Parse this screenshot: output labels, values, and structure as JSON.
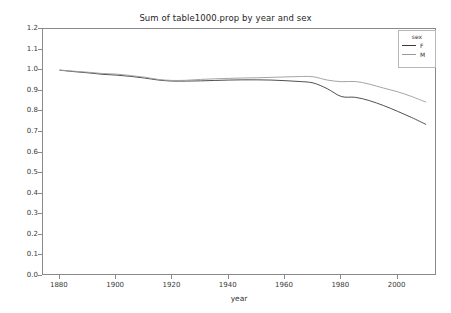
{
  "chart_data": {
    "type": "line",
    "title": "Sum of table1000.prop by year and sex",
    "xlabel": "year",
    "ylabel": "",
    "xlim": [
      1874,
      2014
    ],
    "ylim": [
      0.0,
      1.2
    ],
    "grid": false,
    "legend": {
      "title": "sex",
      "position": "upper right",
      "entries": [
        {
          "name": "F",
          "color": "#3b3b3b"
        },
        {
          "name": "M",
          "color": "#9a9a9a"
        }
      ]
    },
    "xticks": [
      1880,
      1900,
      1920,
      1940,
      1960,
      1980,
      2000
    ],
    "xtick_labels": [
      "1880",
      "1900",
      "1920",
      "1940",
      "1960",
      "1980",
      "2000"
    ],
    "yticks": [
      0.0,
      0.1,
      0.2,
      0.3,
      0.4,
      0.5,
      0.6,
      0.7,
      0.8,
      0.9,
      1.0,
      1.1,
      1.2
    ],
    "ytick_labels": [
      "0.0",
      "0.1",
      "0.2",
      "0.3",
      "0.4",
      "0.5",
      "0.6",
      "0.7",
      "0.8",
      "0.9",
      "1.0",
      "1.1",
      "1.2"
    ],
    "x": [
      1880,
      1885,
      1890,
      1895,
      1900,
      1905,
      1910,
      1915,
      1920,
      1925,
      1930,
      1935,
      1940,
      1945,
      1950,
      1955,
      1960,
      1965,
      1970,
      1975,
      1980,
      1985,
      1990,
      1995,
      2000,
      2005,
      2010
    ],
    "series": [
      {
        "name": "F",
        "color": "#3b3b3b",
        "values": [
          1.0,
          0.993,
          0.987,
          0.98,
          0.976,
          0.97,
          0.962,
          0.952,
          0.947,
          0.947,
          0.948,
          0.95,
          0.952,
          0.953,
          0.953,
          0.952,
          0.949,
          0.945,
          0.938,
          0.91,
          0.872,
          0.868,
          0.852,
          0.828,
          0.8,
          0.77,
          0.737
        ]
      },
      {
        "name": "M",
        "color": "#9a9a9a",
        "values": [
          1.0,
          0.995,
          0.99,
          0.984,
          0.981,
          0.974,
          0.966,
          0.955,
          0.95,
          0.951,
          0.955,
          0.958,
          0.96,
          0.962,
          0.963,
          0.965,
          0.967,
          0.969,
          0.968,
          0.952,
          0.944,
          0.945,
          0.932,
          0.913,
          0.895,
          0.872,
          0.845
        ]
      }
    ]
  }
}
